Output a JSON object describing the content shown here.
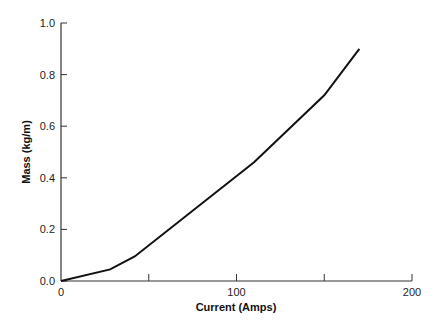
{
  "chart_data": {
    "type": "line",
    "title": "",
    "xlabel": "Current (Amps)",
    "ylabel": "Mass (kg/m)",
    "xlim": [
      0,
      200
    ],
    "ylim": [
      0.0,
      1.0
    ],
    "x_ticks": [
      "0",
      "100",
      "200"
    ],
    "x_minor_ticks": [
      50,
      150
    ],
    "y_ticks": [
      "0.0",
      "0.2",
      "0.4",
      "0.6",
      "0.8",
      "1.0"
    ],
    "grid": false,
    "series": [
      {
        "name": "Mass vs Current",
        "x": [
          0,
          28,
          42,
          110,
          150,
          170
        ],
        "y": [
          0.0,
          0.045,
          0.095,
          0.46,
          0.72,
          0.9
        ]
      }
    ]
  }
}
